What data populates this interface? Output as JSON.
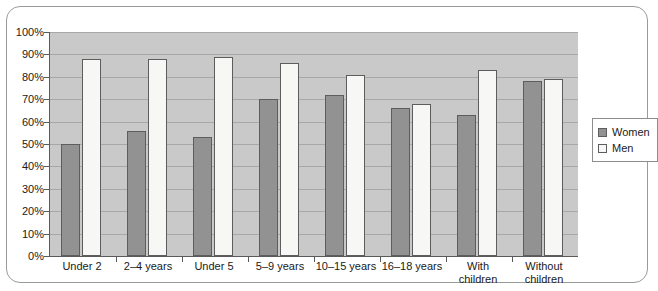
{
  "chart_data": {
    "type": "bar",
    "title": "",
    "xlabel": "",
    "ylabel": "",
    "ylim": [
      0,
      100
    ],
    "grid": true,
    "legend_position": "right",
    "categories": [
      "Under 2",
      "2–4 years",
      "Under 5",
      "5–9 years",
      "10–15 years",
      "16–18 years",
      "With\nchildren",
      "Without\nchildren"
    ],
    "series": [
      {
        "name": "Women",
        "color": "#929292",
        "values": [
          50,
          56,
          53,
          70,
          72,
          66,
          63,
          78
        ]
      },
      {
        "name": "Men",
        "color": "#f7f7f5",
        "values": [
          88,
          88,
          89,
          86,
          81,
          68,
          83,
          79
        ]
      }
    ],
    "ytick_labels": [
      "0%",
      "10%",
      "20%",
      "30%",
      "40%",
      "50%",
      "60%",
      "70%",
      "80%",
      "90%",
      "100%"
    ],
    "ytick_values": [
      0,
      10,
      20,
      30,
      40,
      50,
      60,
      70,
      80,
      90,
      100
    ]
  },
  "legend": {
    "items": [
      {
        "label": "Women",
        "swatch": "women"
      },
      {
        "label": "Men",
        "swatch": "men"
      }
    ]
  }
}
